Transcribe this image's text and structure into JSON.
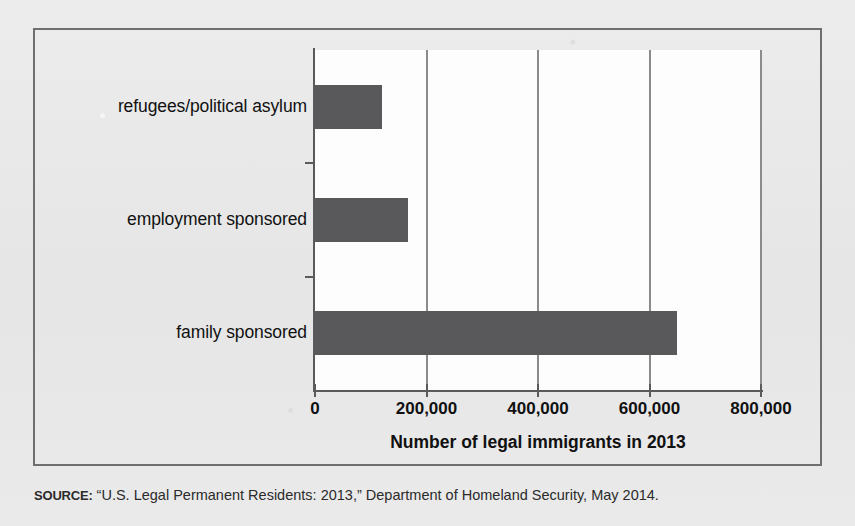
{
  "chart_data": {
    "type": "bar",
    "orientation": "horizontal",
    "title": "",
    "xlabel": "Number of legal immigrants in 2013",
    "ylabel": "",
    "categories": [
      "family sponsored",
      "employment sponsored",
      "refugees/political asylum"
    ],
    "values": [
      649000,
      167000,
      121000
    ],
    "xlim": [
      0,
      800000
    ],
    "xticks": [
      0,
      200000,
      400000,
      600000,
      800000
    ],
    "xtick_labels": [
      "0",
      "200,000",
      "400,000",
      "600,000",
      "800,000"
    ],
    "grid": "vertical",
    "legend": "none",
    "bar_color": "#59595b",
    "series": [
      {
        "name": "Number of legal immigrants in 2013",
        "points": [
          {
            "category": "family sponsored",
            "value": 649000
          },
          {
            "category": "employment sponsored",
            "value": 167000
          },
          {
            "category": "refugees/political asylum",
            "value": 121000
          }
        ]
      }
    ]
  },
  "figure": {
    "background_color": "#e9e9e9",
    "plot_background_color": "#fdfdfd",
    "border_color": "#6f6f6f"
  },
  "source": {
    "label": "SOURCE:",
    "text": " “U.S. Legal Permanent Residents: 2013,” Department of Homeland Security, May 2014."
  }
}
